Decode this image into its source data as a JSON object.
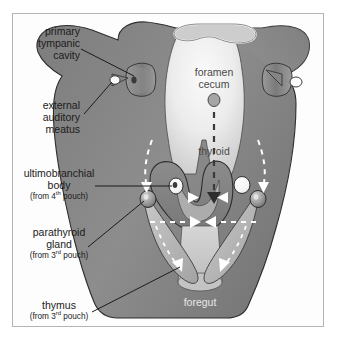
{
  "figure": {
    "border_color": "#b4b4b4",
    "background_color": "#ffffff"
  },
  "colors": {
    "outer_body": "#8a8a8a",
    "outer_body_dark": "#6f6f6f",
    "pharynx_light": "#e2e2e2",
    "tongue_light": "#f1f1f1",
    "thymus_strand": "#b9b9b9",
    "ultimobranchial_white": "#fbfbfb",
    "parathyroid_gray": "#9a9a9a",
    "arrow_white": "#ffffff",
    "outline": "#2e2e2e",
    "leader_line": "#1b1b1b",
    "label_text": "#1b1b1b",
    "inner_label_text": "#4a4a4a",
    "foregut_label_text": "#e8e8e8"
  },
  "labels": {
    "primary_tympanic_cavity": {
      "lines": [
        "primary",
        "tympanic",
        "cavity"
      ],
      "align": "right"
    },
    "external_auditory_meatus": {
      "lines": [
        "external",
        "auditory",
        "meatus"
      ],
      "align": "right"
    },
    "ultimobranchial_body": {
      "lines": [
        "ultimobranchial",
        "body"
      ],
      "sub_prefix": "(from 4",
      "sub_sup": "th",
      "sub_suffix": " pouch)",
      "align": "center"
    },
    "parathyroid_gland": {
      "lines": [
        "parathyroid",
        "gland"
      ],
      "sub_prefix": "(from 3",
      "sub_sup": "rd",
      "sub_suffix": " pouch)",
      "align": "center"
    },
    "thymus": {
      "lines": [
        "thymus"
      ],
      "sub_prefix": "(from 3",
      "sub_sup": "rd",
      "sub_suffix": " pouch)",
      "align": "center"
    }
  },
  "inner_labels": {
    "foramen_cecum": {
      "line1": "foramen",
      "line2": "cecum"
    },
    "thyroid": {
      "text": "thyroid"
    },
    "foregut": {
      "text": "foregut"
    }
  },
  "structures": [
    {
      "name": "stomodeum-opening",
      "description": "mouth opening at top outlined in white"
    },
    {
      "name": "foramen-cecum-marker",
      "description": "small gray oval below foramen cecum label"
    },
    {
      "name": "thyroid-descent-arrow",
      "description": "vertical dashed arrow from foramen cecum to thyroid"
    },
    {
      "name": "ultimobranchial-body-left",
      "description": "white circle left of midline"
    },
    {
      "name": "ultimobranchial-body-right",
      "description": "white circle right of midline"
    },
    {
      "name": "parathyroid-gland-left",
      "description": "gray sphere on left arch"
    },
    {
      "name": "parathyroid-gland-right",
      "description": "gray sphere on right arch"
    },
    {
      "name": "thymus-strand-left",
      "description": "elongated light gray strand descending left"
    },
    {
      "name": "thymus-strand-right",
      "description": "elongated light gray strand descending right"
    },
    {
      "name": "migration-arc-left",
      "description": "dashed curved arrow descending on left"
    },
    {
      "name": "migration-arc-right",
      "description": "dashed curved arrow descending on right"
    },
    {
      "name": "migration-arrows-inward",
      "description": "white arrowheads converging toward midline"
    },
    {
      "name": "external-auditory-meatus-left",
      "description": "white dot at left ear"
    },
    {
      "name": "external-auditory-meatus-right",
      "description": "white dot at right ear"
    },
    {
      "name": "primary-tympanic-cavity-left",
      "description": "funnel shape at left ear"
    },
    {
      "name": "primary-tympanic-cavity-right",
      "description": "funnel shape at right ear"
    }
  ]
}
